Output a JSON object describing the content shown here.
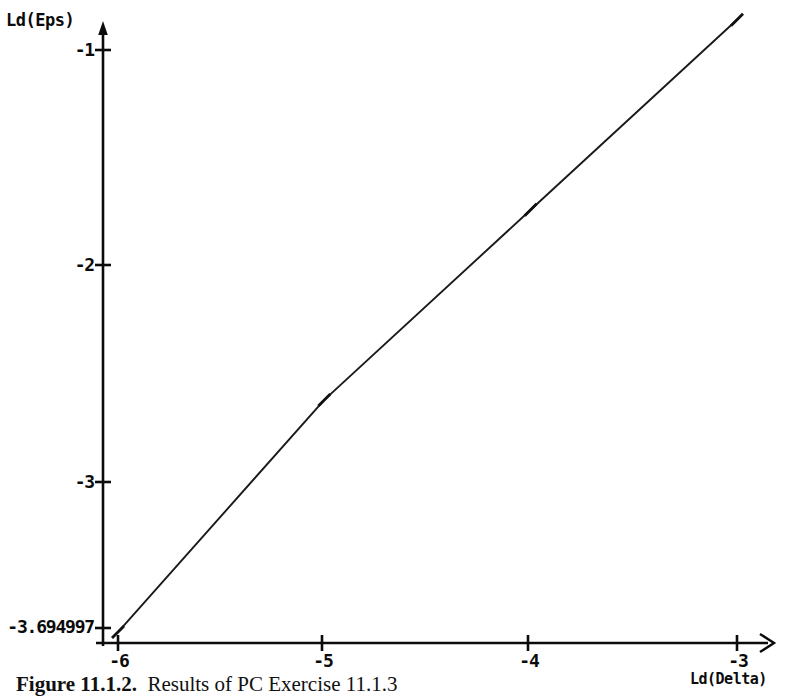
{
  "figure": {
    "caption_number": "Figure 11.1.2.",
    "caption_text": "Results of PC Exercise 11.1.3"
  },
  "axis_titles": {
    "y": "Ld(Eps)",
    "x": "Ld(Delta)"
  },
  "colors": {
    "ink": "#0b0b0b",
    "background": "#ffffff"
  },
  "chart_data": {
    "type": "line",
    "title": "",
    "xlabel": "Ld(Delta)",
    "ylabel": "Ld(Eps)",
    "xlim": [
      -6.15,
      -2.85
    ],
    "ylim": [
      -3.82,
      -0.78
    ],
    "grid": false,
    "legend": "none",
    "x_ticks": [
      -6,
      -5,
      -4,
      -3
    ],
    "x_tick_labels": [
      "-6",
      "-5",
      "-4",
      "-3"
    ],
    "y_ticks": [
      -1,
      -2,
      -3,
      -3.694997
    ],
    "y_tick_labels": [
      "-1",
      "-2",
      "-3",
      "-3.694997"
    ],
    "axis_style": "arrow-ended single lines, no box, no gridlines",
    "series": [
      {
        "name": "Ld(Eps) vs Ld(Delta)",
        "marker": "tick",
        "x": [
          -6,
          -5,
          -4,
          -3
        ],
        "y": [
          -3.694997,
          -2.62,
          -1.74,
          -0.86
        ]
      }
    ],
    "annotations": []
  }
}
